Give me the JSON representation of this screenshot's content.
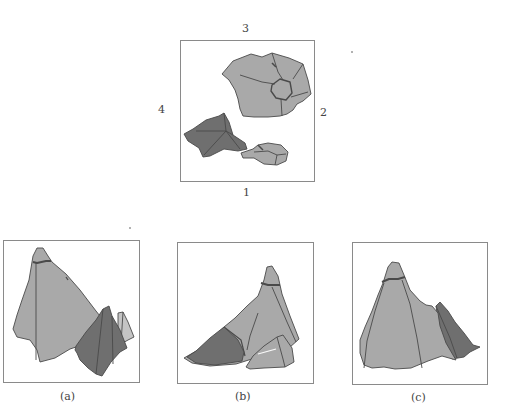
{
  "figure": {
    "top_view": {
      "side_labels": {
        "top": "3",
        "right": "2",
        "bottom": "1",
        "left": "4"
      }
    },
    "panels": [
      {
        "id": "a",
        "caption": "(a)"
      },
      {
        "id": "b",
        "caption": "(b)"
      },
      {
        "id": "c",
        "caption": "(c)"
      }
    ],
    "colors": {
      "rock_light": "#a9a9a9",
      "rock_dark": "#6f6f6f",
      "rock_outline": "#4a4a4a",
      "frame": "#8a8a8a"
    }
  }
}
